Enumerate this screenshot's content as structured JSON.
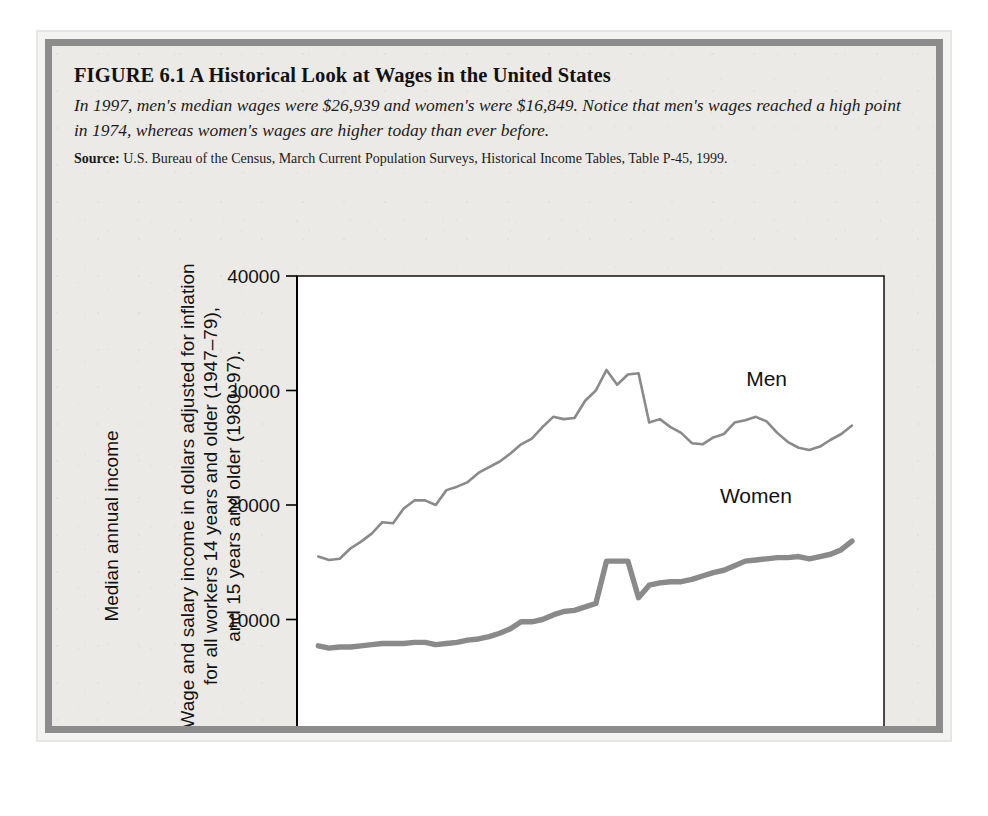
{
  "figure": {
    "title": "FIGURE 6.1  A Historical Look at Wages in the United States",
    "description": "In 1997, men's median wages were $26,939 and women's were $16,849. Notice that men's wages reached a high point in 1974, whereas women's wages are higher today than ever before.",
    "source_label": "Source:",
    "source_text": "U.S. Bureau of the Census, March Current Population Surveys, Historical Income Tables, Table P-45, 1999."
  },
  "chart_data": {
    "type": "line",
    "title": "",
    "xlabel": "",
    "ylabel_line1": "Median annual income",
    "ylabel_line2": "Wage and salary income in dollars adjusted for inflation",
    "ylabel_line3": "for all workers 14 years and older (1947–79),",
    "ylabel_line4": "and 15 years and older (1980–97).",
    "xlim": [
      1945,
      2000
    ],
    "ylim": [
      0,
      40000
    ],
    "xticks": [
      1945,
      1950,
      1955,
      1960,
      1965,
      1970,
      1975,
      1980,
      1985,
      1990,
      1995,
      2000
    ],
    "xticklabels": [
      "1945",
      "1950",
      "1955",
      "1960",
      "1965",
      "1970",
      "1975",
      "1980",
      "1985",
      "1990",
      "1995",
      "2000"
    ],
    "yticks": [
      0,
      10000,
      20000,
      30000,
      40000
    ],
    "yticklabels": [
      "0",
      "10000",
      "20000",
      "30000",
      "40000"
    ],
    "grid": false,
    "legend_position": "inline-annotation",
    "line_color": "#8a8a8a",
    "plot_background": "#ffffff",
    "annotations": [
      {
        "text": "Men",
        "x": 1989,
        "y": 30400
      },
      {
        "text": "Women",
        "x": 1988,
        "y": 20200
      }
    ],
    "x": [
      1947,
      1948,
      1949,
      1950,
      1951,
      1952,
      1953,
      1954,
      1955,
      1956,
      1957,
      1958,
      1959,
      1960,
      1961,
      1962,
      1963,
      1964,
      1965,
      1966,
      1967,
      1968,
      1969,
      1970,
      1971,
      1972,
      1973,
      1974,
      1975,
      1976,
      1977,
      1978,
      1979,
      1980,
      1981,
      1982,
      1983,
      1984,
      1985,
      1986,
      1987,
      1988,
      1989,
      1990,
      1991,
      1992,
      1993,
      1994,
      1995,
      1996,
      1997
    ],
    "series": [
      {
        "name": "Men",
        "values": [
          15500,
          15200,
          15300,
          16200,
          16800,
          17500,
          18500,
          18400,
          19700,
          20400,
          20400,
          20000,
          21300,
          21600,
          22000,
          22800,
          23300,
          23800,
          24500,
          25300,
          25800,
          26800,
          27700,
          27500,
          27600,
          29100,
          30000,
          31800,
          30500,
          31400,
          31500,
          27200,
          27500,
          26800,
          26300,
          25400,
          25300,
          25900,
          26200,
          27200,
          27400,
          27700,
          27300,
          26300,
          25500,
          25000,
          24800,
          25100,
          25700,
          26200,
          26939
        ]
      },
      {
        "name": "Women",
        "values": [
          7700,
          7500,
          7600,
          7600,
          7700,
          7800,
          7900,
          7900,
          7900,
          8000,
          8000,
          7800,
          7900,
          8000,
          8200,
          8300,
          8500,
          8800,
          9200,
          9800,
          9800,
          10000,
          10400,
          10700,
          10800,
          11100,
          11400,
          15100,
          15100,
          15100,
          11900,
          13000,
          13200,
          13300,
          13300,
          13500,
          13800,
          14100,
          14300,
          14700,
          15100,
          15200,
          15300,
          15400,
          15400,
          15500,
          15300,
          15500,
          15700,
          16100,
          16849
        ]
      }
    ]
  }
}
